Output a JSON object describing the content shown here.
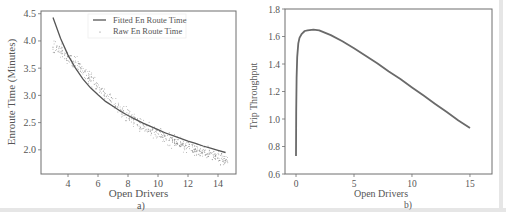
{
  "colors": {
    "axis": "#6e6e6e",
    "fitted_line": "#555555",
    "raw_points": "#777777",
    "throughput_line": "#6a6a6a",
    "text": "#555555",
    "frame_shadow": "#e6e6e6"
  },
  "chart_data": [
    {
      "id": "a",
      "type": "scatter",
      "caption": "a)",
      "title": "",
      "xlabel": "Open Drivers",
      "ylabel": "Enroute Time (Minutes)",
      "xlim": [
        2.2,
        15.2
      ],
      "ylim": [
        1.556,
        4.55
      ],
      "xticks": [
        4,
        6,
        8,
        10,
        12,
        14
      ],
      "yticks": [
        2.0,
        2.5,
        3.0,
        3.5,
        4.0,
        4.5
      ],
      "ytick_labels": [
        "2.0",
        "2.5",
        "3.0",
        "3.5",
        "4.0",
        "4.5"
      ],
      "grid": false,
      "legend": {
        "position": "upper center",
        "entries": [
          "Fitted En Route Time",
          "Raw En Route Time"
        ]
      },
      "series": [
        {
          "name": "Fitted En Route Time",
          "type": "line",
          "x": [
            3.0,
            3.5,
            4.0,
            4.5,
            5.0,
            5.5,
            6.0,
            6.5,
            7.0,
            7.5,
            8.0,
            8.5,
            9.0,
            9.5,
            10.0,
            10.5,
            11.0,
            11.5,
            12.0,
            12.5,
            13.0,
            13.5,
            14.0,
            14.5
          ],
          "y": [
            4.43,
            4.05,
            3.74,
            3.5,
            3.3,
            3.14,
            3.01,
            2.89,
            2.8,
            2.71,
            2.63,
            2.56,
            2.49,
            2.43,
            2.37,
            2.31,
            2.26,
            2.21,
            2.16,
            2.12,
            2.07,
            2.03,
            1.99,
            1.95
          ]
        },
        {
          "name": "Raw En Route Time",
          "type": "scatter",
          "x_range": [
            3.0,
            14.7
          ],
          "trend_x": [
            3.0,
            3.5,
            4.0,
            4.5,
            5.0,
            5.5,
            6.0,
            6.5,
            7.0,
            7.5,
            8.0,
            8.5,
            9.0,
            9.5,
            10.0,
            10.5,
            11.0,
            11.5,
            12.0,
            12.5,
            13.0,
            13.5,
            14.0,
            14.5
          ],
          "trend_y": [
            3.9,
            3.82,
            3.72,
            3.6,
            3.45,
            3.3,
            3.15,
            3.0,
            2.86,
            2.74,
            2.63,
            2.53,
            2.44,
            2.36,
            2.28,
            2.22,
            2.16,
            2.1,
            2.05,
            2.0,
            1.95,
            1.91,
            1.87,
            1.82
          ],
          "spread": 0.08,
          "count": 600
        }
      ]
    },
    {
      "id": "b",
      "type": "line",
      "caption": "b)",
      "title": "",
      "xlabel": "Open Drivers",
      "ylabel": "Trip Throughput",
      "xlim": [
        -0.95,
        16.9
      ],
      "ylim": [
        0.6,
        1.8
      ],
      "xticks": [
        0,
        5,
        10,
        15
      ],
      "yticks": [
        0.6,
        0.8,
        1.0,
        1.2,
        1.4,
        1.6,
        1.8
      ],
      "ytick_labels": [
        "0.6",
        "0.8",
        "1.0",
        "1.2",
        "1.4",
        "1.6",
        "1.8"
      ],
      "grid": false,
      "series": [
        {
          "name": "Trip Throughput",
          "x": [
            0.0,
            0.02,
            0.05,
            0.1,
            0.2,
            0.3,
            0.5,
            0.75,
            1.0,
            1.5,
            2.0,
            3.0,
            4.0,
            5.0,
            6.0,
            7.0,
            8.0,
            9.0,
            10.0,
            11.0,
            12.0,
            13.0,
            14.0,
            15.0
          ],
          "y": [
            0.73,
            1.05,
            1.3,
            1.45,
            1.55,
            1.59,
            1.62,
            1.64,
            1.645,
            1.65,
            1.645,
            1.61,
            1.565,
            1.515,
            1.46,
            1.405,
            1.345,
            1.29,
            1.23,
            1.17,
            1.11,
            1.05,
            0.99,
            0.935
          ]
        }
      ]
    }
  ]
}
